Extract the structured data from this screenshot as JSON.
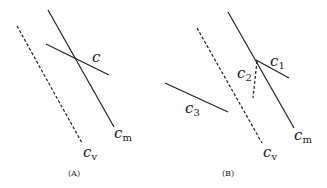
{
  "panels": [
    {
      "caption": "(A)",
      "labels": {
        "c": "c",
        "cm": "c",
        "cm_sub": "m",
        "cv": "c",
        "cv_sub": "v"
      }
    },
    {
      "caption": "(B)",
      "labels": {
        "c1": "c",
        "c1_sub": "1",
        "c2": "c",
        "c2_sub": "2",
        "c3": "c",
        "c3_sub": "3",
        "cm": "c",
        "cm_sub": "m",
        "cv": "c",
        "cv_sub": "v"
      }
    }
  ]
}
